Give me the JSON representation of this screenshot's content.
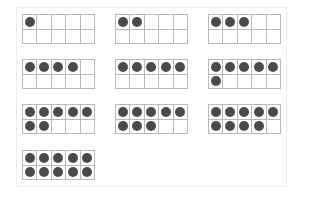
{
  "colors": {
    "dot": "#4a4a4a",
    "grid_line": "#b8b8b8",
    "panel_border": "#ececec",
    "background": "#ffffff"
  },
  "ten_frames": [
    {
      "count": 1,
      "x": 22,
      "y": 14
    },
    {
      "count": 2,
      "x": 115,
      "y": 14
    },
    {
      "count": 3,
      "x": 208,
      "y": 14
    },
    {
      "count": 4,
      "x": 22,
      "y": 59
    },
    {
      "count": 5,
      "x": 115,
      "y": 59
    },
    {
      "count": 6,
      "x": 208,
      "y": 59
    },
    {
      "count": 7,
      "x": 22,
      "y": 104
    },
    {
      "count": 8,
      "x": 115,
      "y": 104
    },
    {
      "count": 9,
      "x": 208,
      "y": 104
    },
    {
      "count": 10,
      "x": 22,
      "y": 150
    }
  ]
}
